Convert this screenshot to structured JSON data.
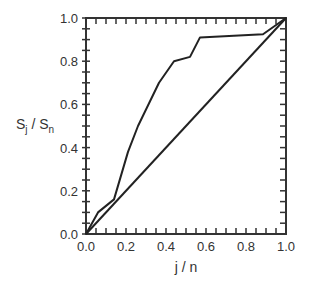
{
  "chart_data": {
    "type": "line",
    "title": "",
    "xlabel": "j / n",
    "ylabel": "S_j / S_n",
    "ylabel_parts": {
      "main1": "S",
      "sub1": "j",
      "sep": " / ",
      "main2": "S",
      "sub2": "n"
    },
    "xlim": [
      0.0,
      1.0
    ],
    "ylim": [
      0.0,
      1.0
    ],
    "grid": false,
    "legend": null,
    "x_tick_labels": [
      "0.0",
      "0.2",
      "0.4",
      "0.6",
      "0.8",
      "1.0"
    ],
    "y_tick_labels": [
      "0.0",
      "0.2",
      "0.4",
      "0.6",
      "0.8",
      "1.0"
    ],
    "series": [
      {
        "name": "cumulative curve",
        "x": [
          0.0,
          0.06,
          0.14,
          0.21,
          0.26,
          0.365,
          0.44,
          0.52,
          0.57,
          0.885,
          1.0
        ],
        "y": [
          0.0,
          0.1,
          0.16,
          0.38,
          0.5,
          0.7,
          0.8,
          0.82,
          0.91,
          0.925,
          1.0
        ]
      },
      {
        "name": "diagonal reference",
        "x": [
          0.0,
          1.0
        ],
        "y": [
          0.0,
          1.0
        ]
      }
    ],
    "colors": {
      "line": "#222222",
      "axis": "#333333",
      "text": "#333333"
    }
  }
}
